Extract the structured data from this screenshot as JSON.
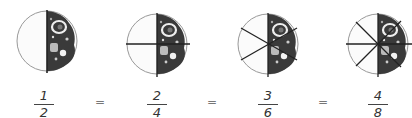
{
  "colors": {
    "pizza_fill": "#3a3a3a",
    "pizza_outline": "#999999",
    "cut_lines": "#222222",
    "topping_light": "#eeeeee"
  },
  "pizzas": [
    {
      "label": "pizza-halves",
      "slices": 2,
      "shaded": 1
    },
    {
      "label": "pizza-quarters",
      "slices": 4,
      "shaded": 2
    },
    {
      "label": "pizza-sixths",
      "slices": 6,
      "shaded": 3
    },
    {
      "label": "pizza-eighths",
      "slices": 8,
      "shaded": 4
    }
  ],
  "fractions": [
    {
      "numerator": "1",
      "denominator": "2"
    },
    {
      "numerator": "2",
      "denominator": "4"
    },
    {
      "numerator": "3",
      "denominator": "6"
    },
    {
      "numerator": "4",
      "denominator": "8"
    }
  ],
  "equals": [
    "=",
    "=",
    "="
  ]
}
